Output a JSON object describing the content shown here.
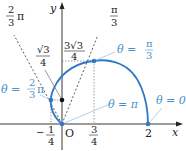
{
  "diagram": {
    "type": "polar-curve",
    "equation_hint": "r = 1 + cos θ",
    "colors": {
      "curve": "#2f78c4",
      "label_blue": "#4a90c8",
      "axis": "#222222",
      "guide": "#555555",
      "leader": "#9cc4e6"
    },
    "axes": {
      "x_label": "x",
      "y_label": "y",
      "origin_label": "O"
    },
    "ticks": {
      "neg_quarter": {
        "num": "1",
        "den": "4",
        "sign": "−"
      },
      "three_quarters": {
        "num": "3",
        "den": "4"
      },
      "two": "2"
    },
    "y_markers": {
      "sqrt3_over_4": {
        "num": "√3",
        "den": "4"
      },
      "three_sqrt3_over_4": {
        "num": "3√3",
        "den": "4"
      }
    },
    "rays": {
      "pi_over_3": {
        "num": "π",
        "den": "3"
      },
      "two_pi_over_3": {
        "num": "2",
        "den": "3",
        "suffix": "π"
      }
    },
    "point_labels": {
      "theta_0": "θ = 0",
      "theta_pi3": {
        "prefix": "θ = ",
        "num": "π",
        "den": "3"
      },
      "theta_2pi3": {
        "prefix": "θ = ",
        "num": "2",
        "den": "3",
        "suffix": "π"
      },
      "theta_pi": "θ = π"
    }
  }
}
